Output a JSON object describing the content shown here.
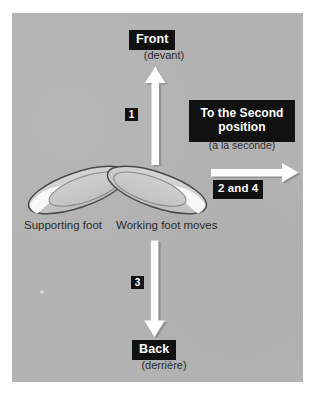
{
  "figure": {
    "background_color": "#b3b3b3",
    "frame_color": "#ffffff"
  },
  "labels": {
    "front": {
      "chip": "Front",
      "french": "(devant)"
    },
    "back": {
      "chip": "Back",
      "french": "(derrière)"
    },
    "second": {
      "chip_line1": "To the Second",
      "chip_line2": "position",
      "french": "(à la seconde)"
    },
    "steps": {
      "up": "1",
      "down": "3",
      "side": "2 and 4"
    },
    "captions": {
      "supporting": "Supporting foot",
      "working": "Working foot moves"
    }
  },
  "arrows": [
    {
      "name": "arrow-up",
      "direction": "up",
      "step_label": "1"
    },
    {
      "name": "arrow-down",
      "direction": "down",
      "step_label": "3"
    },
    {
      "name": "arrow-right",
      "direction": "right",
      "step_label": "2 and 4"
    }
  ],
  "feet": [
    {
      "name": "supporting-foot",
      "side": "left",
      "caption": "Supporting foot"
    },
    {
      "name": "working-foot",
      "side": "right",
      "caption": "Working foot moves"
    }
  ],
  "colors": {
    "panel": "#b3b3b3",
    "chip_background": "#111111",
    "chip_text": "#ffffff",
    "body_text": "#2b2b2b",
    "arrow_fill": "#ffffff",
    "foot_fill": "#c9c9c9",
    "foot_outline": "#4a4a4a",
    "foot_highlight": "#f2f2f2"
  }
}
